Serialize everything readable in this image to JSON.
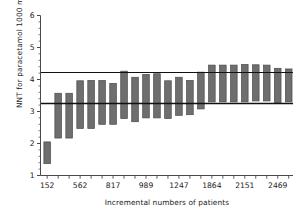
{
  "chart_data": {
    "type": "bar",
    "title": "",
    "subtitle": "",
    "xlabel": "Incremental numbers of patients",
    "ylabel": "NNT for paracetamol 1000 mg",
    "ylim": [
      1,
      6
    ],
    "y_ticks": [
      1,
      2,
      3,
      4,
      5,
      6
    ],
    "y_tick_labels": [
      "1",
      "2",
      "3",
      "4",
      "5",
      "6"
    ],
    "y_minor_ticks_per_interval": 4,
    "x_tick_labels": [
      "152",
      "562",
      "817",
      "989",
      "1247",
      "1864",
      "2151",
      "2469"
    ],
    "x_tick_label_positions": [
      0,
      3,
      6,
      9,
      12,
      15,
      18,
      21
    ],
    "grid": false,
    "legend": null,
    "bar_color": "#6e6e6e",
    "bar_edge_color": "#4a4a4a",
    "axis_color": "#4a4a4a",
    "reference_lines": [
      {
        "name": "upper-reference-line",
        "value": 4.22,
        "color": "#111111"
      },
      {
        "name": "lower-reference-line",
        "value": 3.25,
        "color": "#111111"
      }
    ],
    "note": "Floating bars show confidence interval (low, high) of NNT at each cumulative patient total.",
    "series": [
      {
        "name": "NNT confidence interval",
        "low_values": [
          1.37,
          2.17,
          2.17,
          2.47,
          2.47,
          2.6,
          2.6,
          2.78,
          2.68,
          2.8,
          2.8,
          2.78,
          2.88,
          2.9,
          3.08,
          3.3,
          3.3,
          3.3,
          3.3,
          3.33,
          3.33,
          3.28,
          3.3
        ],
        "high_values": [
          2.05,
          3.57,
          3.57,
          3.96,
          3.97,
          3.97,
          3.88,
          4.26,
          4.07,
          4.16,
          4.18,
          3.96,
          4.07,
          3.97,
          4.23,
          4.45,
          4.45,
          4.45,
          4.47,
          4.46,
          4.45,
          4.35,
          4.33
        ]
      }
    ],
    "bar_count": 23
  }
}
